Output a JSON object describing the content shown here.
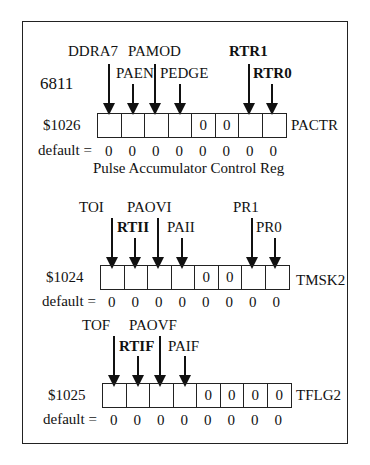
{
  "chip_label": "6811",
  "registers": [
    {
      "name": "PACTR",
      "address": "$1026",
      "caption": "Pulse Accumulator Control Reg",
      "default_label": "default =",
      "cells": [
        "",
        "",
        "",
        "",
        "0",
        "0",
        "",
        ""
      ],
      "defaults": [
        "0",
        "0",
        "0",
        "0",
        "0",
        "0",
        "0",
        "0"
      ],
      "bit_labels": [
        {
          "bit": 7,
          "label": "DDRA7",
          "bold": false,
          "row": "upper"
        },
        {
          "bit": 6,
          "label": "PAEN",
          "bold": false,
          "row": "lower"
        },
        {
          "bit": 5,
          "label": "PAMOD",
          "bold": false,
          "row": "upper"
        },
        {
          "bit": 4,
          "label": "PEDGE",
          "bold": false,
          "row": "lower"
        },
        {
          "bit": 1,
          "label": "RTR1",
          "bold": true,
          "row": "upper"
        },
        {
          "bit": 0,
          "label": "RTR0",
          "bold": true,
          "row": "lower"
        }
      ]
    },
    {
      "name": "TMSK2",
      "address": "$1024",
      "caption": "",
      "default_label": "default =",
      "cells": [
        "",
        "",
        "",
        "",
        "0",
        "0",
        "",
        ""
      ],
      "defaults": [
        "0",
        "0",
        "0",
        "0",
        "0",
        "0",
        "0",
        "0"
      ],
      "bit_labels": [
        {
          "bit": 7,
          "label": "TOI",
          "bold": false,
          "row": "upper"
        },
        {
          "bit": 6,
          "label": "RTII",
          "bold": true,
          "row": "lower"
        },
        {
          "bit": 5,
          "label": "PAOVI",
          "bold": false,
          "row": "upper"
        },
        {
          "bit": 4,
          "label": "PAII",
          "bold": false,
          "row": "lower"
        },
        {
          "bit": 1,
          "label": "PR1",
          "bold": false,
          "row": "upper"
        },
        {
          "bit": 0,
          "label": "PR0",
          "bold": false,
          "row": "lower"
        }
      ]
    },
    {
      "name": "TFLG2",
      "address": "$1025",
      "caption": "",
      "default_label": "default =",
      "cells": [
        "",
        "",
        "",
        "",
        "0",
        "0",
        "0",
        "0"
      ],
      "defaults": [
        "0",
        "0",
        "0",
        "0",
        "0",
        "0",
        "0",
        "0"
      ],
      "bit_labels": [
        {
          "bit": 7,
          "label": "TOF",
          "bold": false,
          "row": "upper"
        },
        {
          "bit": 6,
          "label": "RTIF",
          "bold": true,
          "row": "lower"
        },
        {
          "bit": 5,
          "label": "PAOVF",
          "bold": false,
          "row": "upper"
        },
        {
          "bit": 4,
          "label": "PAIF",
          "bold": false,
          "row": "lower"
        }
      ]
    }
  ]
}
